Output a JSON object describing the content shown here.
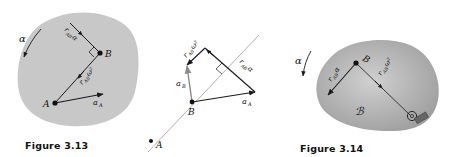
{
  "figures": [
    {
      "id": "fig-3-13",
      "caption": "Figure 3.13",
      "labels": {
        "alpha": "α",
        "point_a": "A",
        "point_b": "B",
        "a_a": "a",
        "a_a_sub": "A",
        "r_ab_alpha": "r",
        "r_ab_alpha_sub": "AB",
        "r_ab_alpha_tail": "α",
        "r_ab_omega2": "r",
        "r_ab_omega2_sub": "AB",
        "r_ab_omega2_tail": "ω²"
      }
    },
    {
      "id": "vector-diagram",
      "labels": {
        "point_a": "A",
        "point_b": "B",
        "a_b": "a",
        "a_b_sub": "B",
        "a_a": "a",
        "a_a_sub": "A",
        "r_ab_omega2": "r",
        "r_ab_omega2_sub": "AB",
        "r_ab_omega2_tail": "ω²",
        "r_ab_alpha": "r",
        "r_ab_alpha_sub": "AB",
        "r_ab_alpha_tail": "α"
      }
    },
    {
      "id": "fig-3-14",
      "caption": "Figure 3.14",
      "labels": {
        "alpha": "α",
        "point_b": "B",
        "body": "ℬ",
        "r_ab_alpha": "r",
        "r_ab_alpha_sub": "AB",
        "r_ab_alpha_tail": "α",
        "r_ab_omega2": "r",
        "r_ab_omega2_sub": "AB",
        "r_ab_omega2_tail": "ω²"
      }
    }
  ],
  "colors": {
    "body_fill_3_13": "#c8c8c8",
    "body_fill_3_14": "#b4b4b4",
    "line": "#1a1a1a",
    "guide_line": "#9a9a9a",
    "arrow_gray": "#8a8a8a"
  }
}
